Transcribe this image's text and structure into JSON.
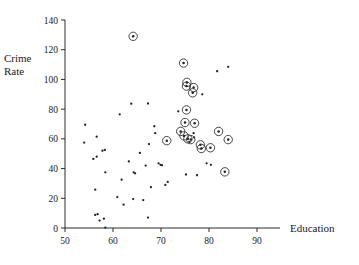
{
  "figure": {
    "background": "#ffffff",
    "ink_color": "#222222"
  },
  "chart_data": {
    "type": "scatter",
    "title": "",
    "xlabel": "Education",
    "ylabel_line1": "Crime",
    "ylabel_line2": "Rate",
    "ylabel": "Crime Rate",
    "xlim": [
      50,
      90
    ],
    "ylim": [
      0,
      140
    ],
    "xticks": [
      50,
      60,
      70,
      80,
      90
    ],
    "yticks": [
      0,
      20,
      40,
      60,
      80,
      100,
      120,
      140
    ],
    "grid": false,
    "legend": null,
    "marker_styles": {
      "plain": "small filled dot",
      "highlighted": "filled dot with open circle around it"
    },
    "series": [
      {
        "name": "plain points",
        "highlighted": false,
        "points": [
          [
            54.2,
            69.5
          ],
          [
            54.0,
            57.5
          ],
          [
            56.6,
            61.5
          ],
          [
            55.9,
            46.5
          ],
          [
            56.6,
            48.0
          ],
          [
            57.8,
            52.0
          ],
          [
            58.3,
            52.5
          ],
          [
            58.4,
            37.5
          ],
          [
            56.3,
            25.8
          ],
          [
            56.3,
            8.8
          ],
          [
            56.8,
            9.3
          ],
          [
            57.2,
            5.0
          ],
          [
            58.1,
            6.3
          ],
          [
            58.4,
            0.3
          ],
          [
            61.4,
            76.5
          ],
          [
            61.8,
            32.5
          ],
          [
            60.9,
            20.8
          ],
          [
            62.2,
            15.7
          ],
          [
            63.3,
            44.8
          ],
          [
            63.8,
            83.7
          ],
          [
            64.3,
            37.5
          ],
          [
            64.6,
            36.8
          ],
          [
            64.2,
            19.5
          ],
          [
            65.6,
            50.5
          ],
          [
            66.3,
            18.8
          ],
          [
            66.8,
            42.0
          ],
          [
            67.3,
            83.8
          ],
          [
            67.5,
            56.5
          ],
          [
            67.9,
            27.5
          ],
          [
            67.3,
            7.0
          ],
          [
            68.6,
            68.5
          ],
          [
            68.8,
            63.8
          ],
          [
            69.5,
            43.5
          ],
          [
            69.9,
            42.5
          ],
          [
            70.2,
            42.3
          ],
          [
            70.9,
            29.0
          ],
          [
            71.4,
            31.0
          ],
          [
            73.6,
            78.5
          ],
          [
            75.2,
            36.0
          ],
          [
            76.8,
            63.8
          ],
          [
            77.5,
            35.5
          ],
          [
            78.6,
            90.0
          ],
          [
            79.5,
            43.5
          ],
          [
            80.4,
            42.5
          ],
          [
            81.7,
            105.5
          ],
          [
            84.0,
            108.5
          ],
          [
            76.9,
            61.0
          ],
          [
            75.9,
            58.0
          ]
        ]
      },
      {
        "name": "highlighted points",
        "highlighted": true,
        "points": [
          [
            64.2,
            129.0
          ],
          [
            74.7,
            111.0
          ],
          [
            75.4,
            98.0
          ],
          [
            75.3,
            95.5
          ],
          [
            76.8,
            94.5
          ],
          [
            76.6,
            91.0
          ],
          [
            75.3,
            79.5
          ],
          [
            75.0,
            71.0
          ],
          [
            77.0,
            70.5
          ],
          [
            74.1,
            65.0
          ],
          [
            74.8,
            62.0
          ],
          [
            75.6,
            60.0
          ],
          [
            76.2,
            59.5
          ],
          [
            71.2,
            58.8
          ],
          [
            78.2,
            56.0
          ],
          [
            78.4,
            53.5
          ],
          [
            80.3,
            54.0
          ],
          [
            82.0,
            65.0
          ],
          [
            84.0,
            59.5
          ],
          [
            83.3,
            37.8
          ]
        ]
      }
    ],
    "point_counts": {
      "plain": 48,
      "highlighted": 20,
      "total": 68
    }
  }
}
